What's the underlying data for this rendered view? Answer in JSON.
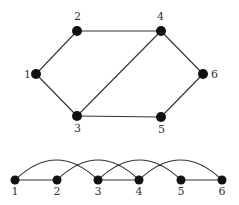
{
  "diagram": {
    "type": "graph",
    "style": {
      "node_color": "#111111",
      "edge_color": "#333333",
      "label_color": "#333333",
      "node_radius": 5
    },
    "top_graph": {
      "nodes": [
        {
          "id": "1",
          "label": "1",
          "x": 36,
          "y": 74,
          "lx": 24,
          "ly": 78
        },
        {
          "id": "2",
          "label": "2",
          "x": 77,
          "y": 31,
          "lx": 74,
          "ly": 20
        },
        {
          "id": "3",
          "label": "3",
          "x": 77,
          "y": 116,
          "lx": 74,
          "ly": 132
        },
        {
          "id": "4",
          "label": "4",
          "x": 161,
          "y": 31,
          "lx": 157,
          "ly": 20
        },
        {
          "id": "5",
          "label": "5",
          "x": 161,
          "y": 117,
          "lx": 158,
          "ly": 133
        },
        {
          "id": "6",
          "label": "6",
          "x": 203,
          "y": 74,
          "lx": 211,
          "ly": 78
        }
      ],
      "edges": [
        [
          "1",
          "2"
        ],
        [
          "1",
          "3"
        ],
        [
          "2",
          "4"
        ],
        [
          "3",
          "4"
        ],
        [
          "3",
          "5"
        ],
        [
          "4",
          "6"
        ],
        [
          "5",
          "6"
        ]
      ]
    },
    "bottom_linear": {
      "baseline_y": 180,
      "nodes": [
        {
          "id": "1",
          "label": "1",
          "x": 15
        },
        {
          "id": "2",
          "label": "2",
          "x": 57
        },
        {
          "id": "3",
          "label": "3",
          "x": 98
        },
        {
          "id": "4",
          "label": "4",
          "x": 139
        },
        {
          "id": "5",
          "label": "5",
          "x": 181
        },
        {
          "id": "6",
          "label": "6",
          "x": 222
        }
      ],
      "straight_edges": [
        [
          "1",
          "2"
        ],
        [
          "3",
          "4"
        ],
        [
          "5",
          "6"
        ]
      ],
      "arc_edges": [
        [
          "1",
          "3"
        ],
        [
          "2",
          "4"
        ],
        [
          "3",
          "5"
        ],
        [
          "4",
          "6"
        ]
      ],
      "arc_height": 20
    }
  }
}
